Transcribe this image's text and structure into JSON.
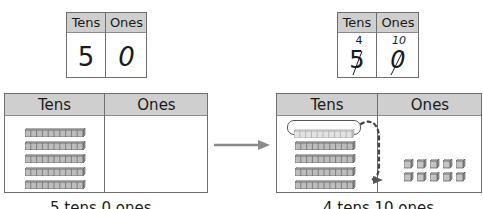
{
  "before": {
    "place_value_chart": {
      "headers": [
        "Tens",
        "Ones"
      ],
      "tens_digit": "5",
      "ones_digit": "0"
    },
    "mat": {
      "headers": [
        "Tens",
        "Ones"
      ],
      "tens_rods": 5,
      "ones_cubes": 0
    },
    "caption": "5 tens 0 ones"
  },
  "after": {
    "place_value_chart": {
      "headers": [
        "Tens",
        "Ones"
      ],
      "tens_regrouped": "4",
      "ones_regrouped": "10",
      "tens_digit_crossed": "5",
      "ones_digit_crossed": "0"
    },
    "mat": {
      "headers": [
        "Tens",
        "Ones"
      ],
      "tens_rods": 4,
      "highlighted_rod": 1,
      "ones_cubes": 10
    },
    "caption": "4 tens 10 ones"
  },
  "colors": {
    "header_fill": "#cfcfcf",
    "border": "#6e6e6e",
    "rod_fill": "#bdbdbd",
    "rod_stroke": "#555555",
    "arrow": "#8a8a8a",
    "dashed_arrow": "#444444"
  }
}
